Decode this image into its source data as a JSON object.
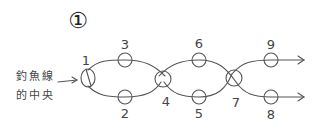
{
  "title": "①",
  "caption": {
    "line1": "釣魚線",
    "line2": "的中央"
  },
  "nodes": [
    {
      "id": "1",
      "label": "1"
    },
    {
      "id": "2",
      "label": "2"
    },
    {
      "id": "3",
      "label": "3"
    },
    {
      "id": "4",
      "label": "4"
    },
    {
      "id": "5",
      "label": "5"
    },
    {
      "id": "6",
      "label": "6"
    },
    {
      "id": "7",
      "label": "7"
    },
    {
      "id": "8",
      "label": "8"
    },
    {
      "id": "9",
      "label": "9"
    }
  ],
  "colors": {
    "ink": "#555555",
    "background": "#ffffff"
  }
}
